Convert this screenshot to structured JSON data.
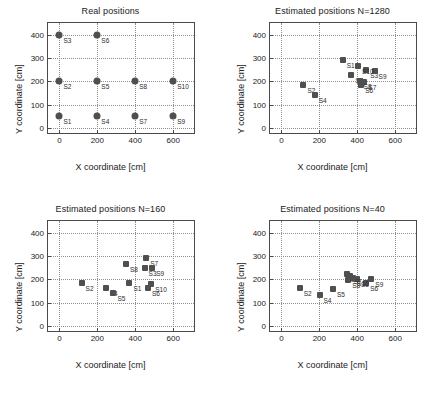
{
  "figure": {
    "axis_label_x": "X coordinate [cm]",
    "axis_label_y": "Y coordinate [cm]",
    "marker_color": "#4f4f4f",
    "grid_color": "#8d8d8d",
    "frame_color": "#4a4a4a"
  },
  "chart_data": [
    {
      "type": "scatter",
      "title": "Real positions",
      "xlabel": "X coordinate [cm]",
      "ylabel": "Y coordinate [cm]",
      "xlim": [
        -60,
        720
      ],
      "ylim": [
        -30,
        450
      ],
      "xticks": [
        0,
        200,
        400,
        600
      ],
      "yticks": [
        0,
        100,
        200,
        300,
        400
      ],
      "xticklabels": [
        "0",
        "200",
        "400",
        "600"
      ],
      "yticklabels": [
        "0",
        "100",
        "200",
        "300",
        "400"
      ],
      "grid": true,
      "marker": "circle",
      "points": [
        {
          "label": "S1",
          "x": 0,
          "y": 50
        },
        {
          "label": "S2",
          "x": 0,
          "y": 200
        },
        {
          "label": "S3",
          "x": 0,
          "y": 400
        },
        {
          "label": "S4",
          "x": 200,
          "y": 50
        },
        {
          "label": "S5",
          "x": 200,
          "y": 200
        },
        {
          "label": "S6",
          "x": 200,
          "y": 400
        },
        {
          "label": "S7",
          "x": 400,
          "y": 50
        },
        {
          "label": "S8",
          "x": 400,
          "y": 200
        },
        {
          "label": "S9",
          "x": 600,
          "y": 50
        },
        {
          "label": "S10",
          "x": 600,
          "y": 200
        }
      ]
    },
    {
      "type": "scatter",
      "title": "Estimated positions N=1280",
      "xlabel": "X coordinate [cm]",
      "ylabel": "Y coordinate [cm]",
      "xlim": [
        -60,
        720
      ],
      "ylim": [
        -30,
        450
      ],
      "xticks": [
        0,
        200,
        400,
        600
      ],
      "yticks": [
        0,
        100,
        200,
        300,
        400
      ],
      "xticklabels": [
        "0",
        "200",
        "400",
        "600"
      ],
      "yticklabels": [
        "0",
        "100",
        "200",
        "300",
        "400"
      ],
      "grid": true,
      "marker": "square",
      "points": [
        {
          "label": "S1",
          "x": 323,
          "y": 291
        },
        {
          "label": "S2",
          "x": 116,
          "y": 184
        },
        {
          "label": "S3",
          "x": 447,
          "y": 249
        },
        {
          "label": "S4",
          "x": 176,
          "y": 140
        },
        {
          "label": "S5",
          "x": 369,
          "y": 226
        },
        {
          "label": "S6",
          "x": 421,
          "y": 183
        },
        {
          "label": "S7",
          "x": 437,
          "y": 199
        },
        {
          "label": "S8",
          "x": 412,
          "y": 201
        },
        {
          "label": "S9",
          "x": 491,
          "y": 246
        },
        {
          "label": "S10",
          "x": 404,
          "y": 267
        }
      ]
    },
    {
      "type": "scatter",
      "title": "Estimated positions N=160",
      "xlabel": "X coordinate [cm]",
      "ylabel": "Y coordinate [cm]",
      "xlim": [
        -60,
        720
      ],
      "ylim": [
        -30,
        450
      ],
      "xticks": [
        0,
        200,
        400,
        600
      ],
      "yticks": [
        0,
        100,
        200,
        300,
        400
      ],
      "xticklabels": [
        "0",
        "200",
        "400",
        "600"
      ],
      "yticklabels": [
        "0",
        "100",
        "200",
        "300",
        "400"
      ],
      "grid": true,
      "marker": "square",
      "points": [
        {
          "label": "S1",
          "x": 369,
          "y": 183
        },
        {
          "label": "S2",
          "x": 117,
          "y": 183
        },
        {
          "label": "S3",
          "x": 449,
          "y": 248
        },
        {
          "label": "S4",
          "x": 244,
          "y": 162
        },
        {
          "label": "S5",
          "x": 285,
          "y": 141
        },
        {
          "label": "S6",
          "x": 467,
          "y": 161
        },
        {
          "label": "S7",
          "x": 458,
          "y": 290
        },
        {
          "label": "S8",
          "x": 351,
          "y": 266
        },
        {
          "label": "S9",
          "x": 489,
          "y": 247
        },
        {
          "label": "S10",
          "x": 484,
          "y": 181
        }
      ]
    },
    {
      "type": "scatter",
      "title": "Estimated positions N=40",
      "xlabel": "X coordinate [cm]",
      "ylabel": "Y coordinate [cm]",
      "xlim": [
        -60,
        720
      ],
      "ylim": [
        -30,
        450
      ],
      "xticks": [
        0,
        200,
        400,
        600
      ],
      "yticks": [
        0,
        100,
        200,
        300,
        400
      ],
      "xticklabels": [
        "0",
        "200",
        "400",
        "600"
      ],
      "yticklabels": [
        "0",
        "100",
        "200",
        "300",
        "400"
      ],
      "grid": true,
      "marker": "square",
      "points": [
        {
          "label": "S1",
          "x": 344,
          "y": 222
        },
        {
          "label": "S2",
          "x": 97,
          "y": 165
        },
        {
          "label": "S3",
          "x": 398,
          "y": 200
        },
        {
          "label": "S4",
          "x": 201,
          "y": 134
        },
        {
          "label": "S5",
          "x": 272,
          "y": 158
        },
        {
          "label": "S6",
          "x": 447,
          "y": 186
        },
        {
          "label": "S7",
          "x": 360,
          "y": 214
        },
        {
          "label": "S8",
          "x": 352,
          "y": 197
        },
        {
          "label": "S9",
          "x": 474,
          "y": 202
        },
        {
          "label": "S10",
          "x": 378,
          "y": 206
        }
      ]
    }
  ]
}
